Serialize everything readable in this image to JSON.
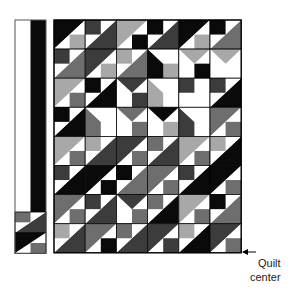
{
  "figure": {
    "annotation": {
      "line1": "Quilt",
      "line2": "center",
      "arrow": "left-arrow"
    },
    "caption": "Layout of the quilt top, left half shown, center at lower right"
  },
  "colors": {
    "W": "#ffffff",
    "K": "#0a0a0a",
    "D": "#3c3c3c",
    "M": "#6e6e6e",
    "L": "#a8a8a8",
    "grid": "#000000"
  },
  "grid": {
    "cols": 6,
    "rows": 8,
    "x0": 54,
    "y0": 20,
    "cellW": 31.2,
    "cellH": 29.1,
    "blocks": [
      [
        "K/W,L,K",
        "D,D/W,W",
        "L/W,K,W",
        "K,D/W,W",
        "K/W,L,W",
        "K,M/W,W"
      ],
      [
        "D,M/W,W",
        "D/W,L,W",
        "L,M/W,W",
        "K\\W,L,W",
        "L^W,K,K",
        "L^W,W,K"
      ],
      [
        "L/W,M,K",
        "K,K/W,W",
        "D^W,D,W",
        "L\\W,W,D",
        "D,K\\W,W",
        "D,K/W,W"
      ],
      [
        "K,K/W,W",
        "M\\W,W,L",
        "M^W,M,W",
        "K^W,L,W",
        "D\\W,W,W",
        "M/W,M,W"
      ],
      [
        "L/W,M,W",
        "L,D/W,W",
        "D/W,M,W",
        "M,D/W,W",
        "L/W,M,W",
        "L,K/W,W"
      ],
      [
        "D,K/W,W",
        "K/W,K,M",
        "K,M/W,W",
        "M/W,M,W",
        "D,K/W,W",
        "K/W,M,W"
      ],
      [
        "M/W,M,W",
        "D,D/W,W",
        "D^W,M,W",
        "M,K/W,W",
        "L/W,M,W",
        "K,M/W,W"
      ],
      [
        "L,D/W,W",
        "M/W,K,W",
        "M,D/W,W",
        "D/W,D,W",
        "L,K/W,W",
        "D/W,M,W"
      ]
    ]
  },
  "strip": {
    "x0": 15,
    "y0": 20,
    "width": 31,
    "plainBottom": 212,
    "plainColors": [
      "W",
      "K"
    ],
    "blocks": [
      "M,D/W,W",
      "K/W,M,W"
    ]
  }
}
